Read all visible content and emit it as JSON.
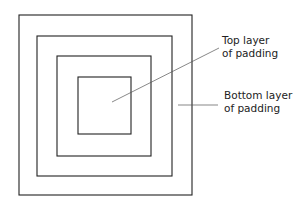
{
  "diagram": {
    "type": "nested-squares",
    "layers": 4,
    "labels": [
      {
        "id": "top-layer",
        "lines": [
          "Top layer",
          "of padding"
        ]
      },
      {
        "id": "bottom-layer",
        "lines": [
          "Bottom layer",
          "of padding"
        ]
      }
    ],
    "colors": {
      "stroke": "#222222",
      "leader": "#555555",
      "background": "#ffffff"
    }
  }
}
